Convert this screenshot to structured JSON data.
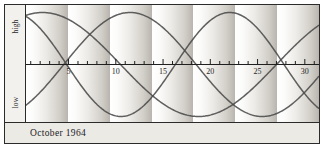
{
  "figure": {
    "caption": "October 1964",
    "axis_labels": {
      "high": "high",
      "low": "low"
    }
  },
  "colors": {
    "frame_border": "#2b2b2b",
    "caption_background": "#eceae5",
    "gutter_background": "#f2f1ee",
    "plot_background": "#ffffff",
    "band_light": "#ffffff",
    "band_dark": "#b9b5ae",
    "curve": "#4a4a4a",
    "axis": "#1f1f1f",
    "text": "#20201f"
  },
  "chart_data": {
    "type": "line",
    "title": "October 1964",
    "xlabel": "",
    "ylabel": "",
    "xlim": [
      0.5,
      31.5
    ],
    "ylim": [
      -1,
      1
    ],
    "grid": false,
    "legend": null,
    "y_axis_annotations": [
      "high",
      "low"
    ],
    "x_tick_labels": [
      "5",
      "10",
      "15",
      "20",
      "25",
      "30"
    ],
    "x_tick_values": [
      5,
      10,
      15,
      20,
      25,
      30
    ],
    "x_minor_ticks": [
      1,
      2,
      3,
      4,
      5,
      6,
      7,
      8,
      9,
      10,
      11,
      12,
      13,
      14,
      15,
      16,
      17,
      18,
      19,
      20,
      21,
      22,
      23,
      24,
      25,
      26,
      27,
      28,
      29,
      30,
      31
    ],
    "background_bands": {
      "description": "alternating vertical gradient bands, light-to-dark left-to-right",
      "count": 7,
      "period_days": 4.4
    },
    "series": [
      {
        "name": "physical",
        "period_days": 23,
        "phase_day": 16.3,
        "amplitude": 1.0
      },
      {
        "name": "emotional",
        "period_days": 28,
        "phase_day": 4.5,
        "amplitude": 1.0
      },
      {
        "name": "intellectual",
        "period_days": 33,
        "phase_day": 27.0,
        "amplitude": 1.0
      }
    ]
  }
}
